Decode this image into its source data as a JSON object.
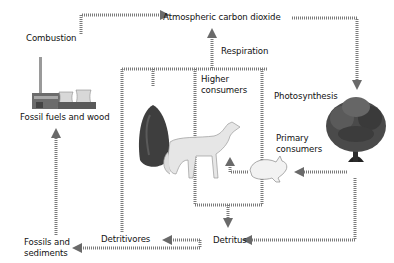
{
  "diagram": {
    "labels": {
      "atmosphere": "Atmospheric carbon dioxide",
      "combustion": "Combustion",
      "fossil_fuels": "Fossil fuels and wood",
      "respiration": "Respiration",
      "higher_consumers_1": "Higher",
      "higher_consumers_2": "consumers",
      "photosynthesis": "Photosynthesis",
      "primary_consumers_1": "Primary",
      "primary_consumers_2": "consumers",
      "fossils_1": "Fossils and",
      "fossils_2": "sediments",
      "detritivores": "Detritivores",
      "detritus": "Detritus"
    },
    "illustrations": [
      "power-plant",
      "deciduous-tree",
      "conifer-tree",
      "coyote",
      "rabbit"
    ],
    "colors": {
      "arrow": "#7a7a7a",
      "text": "#111111",
      "tree": "#3a3a3a",
      "animal": "#e4e4e4"
    }
  }
}
